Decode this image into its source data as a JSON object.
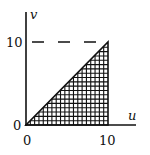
{
  "diagram": {
    "type": "region-plot",
    "axes": {
      "x_label": "u",
      "y_label": "v",
      "x_ticks": [
        "0",
        "10"
      ],
      "y_ticks": [
        "0",
        "10"
      ]
    },
    "region": {
      "shape": "triangle",
      "vertices": [
        [
          0,
          0
        ],
        [
          10,
          0
        ],
        [
          10,
          10
        ]
      ],
      "fill": "crosshatch",
      "boundary_line": "v = u"
    },
    "guide_line": {
      "style": "dashed",
      "level": "v = 10"
    },
    "colors": {
      "ink": "#111111",
      "background": "#ffffff"
    }
  }
}
